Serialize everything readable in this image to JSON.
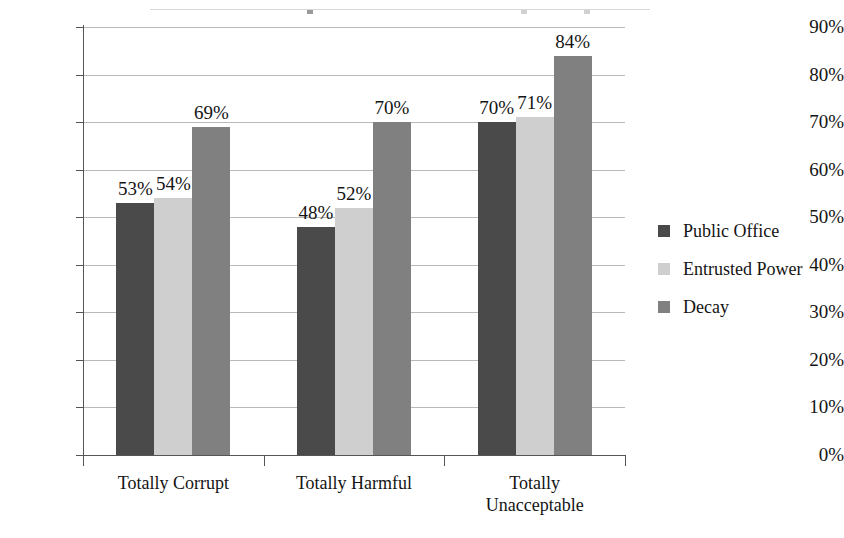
{
  "chart_data": {
    "type": "bar",
    "title": "",
    "xlabel": "",
    "ylabel": "",
    "ylim": [
      0,
      90
    ],
    "ytick_labels": [
      "90%",
      "80%",
      "70%",
      "60%",
      "50%",
      "40%",
      "30%",
      "20%",
      "10%",
      "0%"
    ],
    "ytick_values": [
      90,
      80,
      70,
      60,
      50,
      40,
      30,
      20,
      10,
      0
    ],
    "grid": true,
    "legend_position": "right",
    "categories": [
      "Totally Corrupt",
      "Totally Harmful",
      "Totally\nUnacceptable"
    ],
    "series": [
      {
        "name": "Public Office",
        "color": "#4a4a4a",
        "values": [
          53,
          54,
          70
        ],
        "value_labels": [
          "53%",
          "54%",
          "70%"
        ]
      },
      {
        "name": "Entrusted Power",
        "color": "#cfcfcf",
        "values": [
          53,
          52,
          71
        ],
        "value_labels": [
          "54%",
          "52%",
          "71%"
        ]
      },
      {
        "name": "Decay",
        "color": "#808080",
        "values": [
          69,
          70,
          84
        ],
        "value_labels": [
          "69%",
          "70%",
          "84%"
        ]
      }
    ],
    "groups": [
      {
        "category": "Totally Corrupt",
        "bars": [
          {
            "series": "Public Office",
            "value": 53,
            "label": "53%",
            "color": "#4a4a4a"
          },
          {
            "series": "Entrusted Power",
            "value": 54,
            "label": "54%",
            "color": "#cfcfcf"
          },
          {
            "series": "Decay",
            "value": 69,
            "label": "69%",
            "color": "#808080"
          }
        ]
      },
      {
        "category": "Totally Harmful",
        "bars": [
          {
            "series": "Public Office",
            "value": 48,
            "label": "48%",
            "color": "#4a4a4a"
          },
          {
            "series": "Entrusted Power",
            "value": 52,
            "label": "52%",
            "color": "#cfcfcf"
          },
          {
            "series": "Decay",
            "value": 70,
            "label": "70%",
            "color": "#808080"
          }
        ]
      },
      {
        "category": "Totally\nUnacceptable",
        "bars": [
          {
            "series": "Public Office",
            "value": 70,
            "label": "70%",
            "color": "#4a4a4a"
          },
          {
            "series": "Entrusted Power",
            "value": 71,
            "label": "71%",
            "color": "#cfcfcf"
          },
          {
            "series": "Decay",
            "value": 84,
            "label": "84%",
            "color": "#808080"
          }
        ]
      }
    ]
  },
  "legend": {
    "items": [
      {
        "label": "Public Office",
        "color": "#4a4a4a"
      },
      {
        "label": "Entrusted Power",
        "color": "#cfcfcf"
      },
      {
        "label": "Decay",
        "color": "#808080"
      }
    ]
  },
  "colors": {
    "axis": "#555555",
    "gridline": "#b9b9b9",
    "text": "#141414",
    "background": "#ffffff"
  }
}
